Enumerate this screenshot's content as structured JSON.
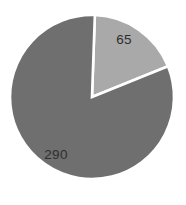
{
  "chart_data": {
    "type": "pie",
    "title": "",
    "subtitle": "",
    "xlabel": "",
    "ylabel": "",
    "grid": false,
    "legend": "none",
    "data_labels": true,
    "total": 355,
    "categories": [
      "65",
      "290"
    ],
    "values": [
      65,
      290
    ],
    "series": [
      {
        "name": "",
        "values": [
          65,
          290
        ]
      }
    ],
    "slices": [
      {
        "label": "65",
        "value": 65,
        "percent": 18.3,
        "color": "#a9a9a9",
        "start_angle_deg": 2,
        "end_angle_deg": 68
      },
      {
        "label": "290",
        "value": 290,
        "percent": 81.7,
        "color": "#6f6f6f",
        "start_angle_deg": 68,
        "end_angle_deg": 362
      }
    ],
    "colors": [
      "#a9a9a9",
      "#6f6f6f"
    ],
    "background_color": "#ffffff",
    "separator_color": "#ffffff",
    "label_color": "#2e2e2e"
  },
  "figure": {
    "center_x": 92,
    "center_y": 97,
    "radius": 82,
    "label_positions": [
      {
        "label": "65",
        "x": 124,
        "y": 40
      },
      {
        "label": "290",
        "x": 56,
        "y": 155
      }
    ]
  }
}
